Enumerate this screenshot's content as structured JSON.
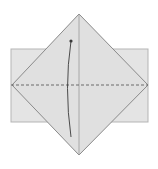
{
  "diagram": {
    "type": "origami-fold-step",
    "colors": {
      "background": "#ffffff",
      "paper": "#e4e4e4",
      "paper_edge": "#b5b5b5",
      "diamond_fill": "#e0e0e0",
      "diamond_edge": "#8a8a8a",
      "crease": "#9a9a9a",
      "valley_fold": "#6a6a6a",
      "arrow": "#3a3a3a"
    },
    "rectangle": {
      "x": 11,
      "y": 49,
      "width": 137,
      "height": 73
    },
    "diamond": {
      "top": [
        79,
        14
      ],
      "right": [
        148,
        85
      ],
      "bottom": [
        79,
        155
      ],
      "left": [
        12,
        85
      ]
    },
    "center_crease": {
      "x1": 79,
      "y1": 14,
      "x2": 79,
      "y2": 155
    },
    "valley_fold_line": {
      "x1": 11,
      "y1": 85,
      "x2": 148,
      "y2": 85
    },
    "fold_arrow": {
      "start": [
        71,
        137
      ],
      "control": [
        64,
        88
      ],
      "end": [
        71,
        41
      ]
    }
  }
}
